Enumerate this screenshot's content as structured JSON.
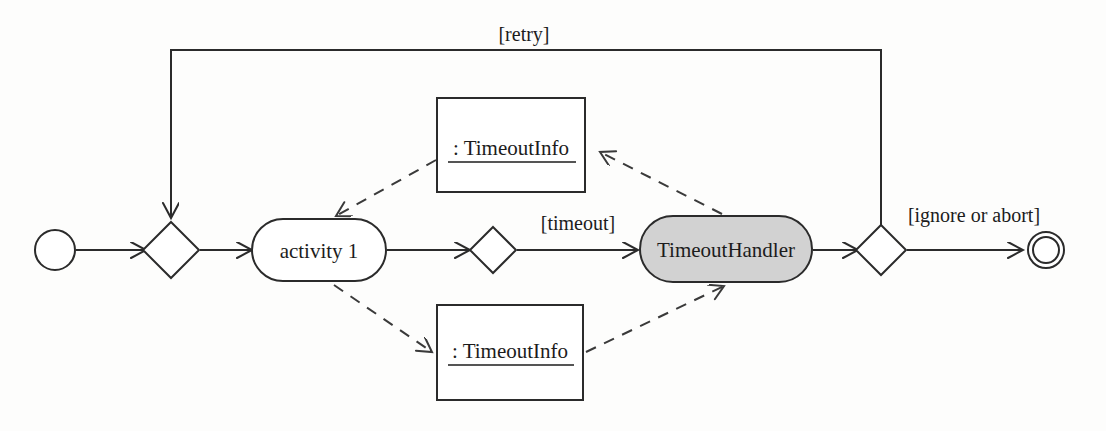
{
  "diagram": {
    "kind": "uml-activity-diagram",
    "background_color": "#fdfdfc",
    "line_color": "#2b2b2b",
    "shaded_fill": "#d2d2d2",
    "nodes": {
      "start": {
        "name": "initial-node",
        "label": ""
      },
      "merge": {
        "name": "merge-node",
        "label": ""
      },
      "activity1": {
        "label": "activity 1"
      },
      "decision_timeout": {
        "name": "timeout-decision",
        "label": ""
      },
      "timeout_handler": {
        "label": "TimeoutHandler"
      },
      "decision_end": {
        "name": "end-decision",
        "label": ""
      },
      "final": {
        "name": "final-node",
        "label": ""
      },
      "object_top": {
        "label": ": TimeoutInfo"
      },
      "object_bottom": {
        "label": ": TimeoutInfo"
      }
    },
    "edge_labels": {
      "retry": "[retry]",
      "timeout": "[timeout]",
      "ignore_or_abort": "[ignore or abort]"
    }
  }
}
